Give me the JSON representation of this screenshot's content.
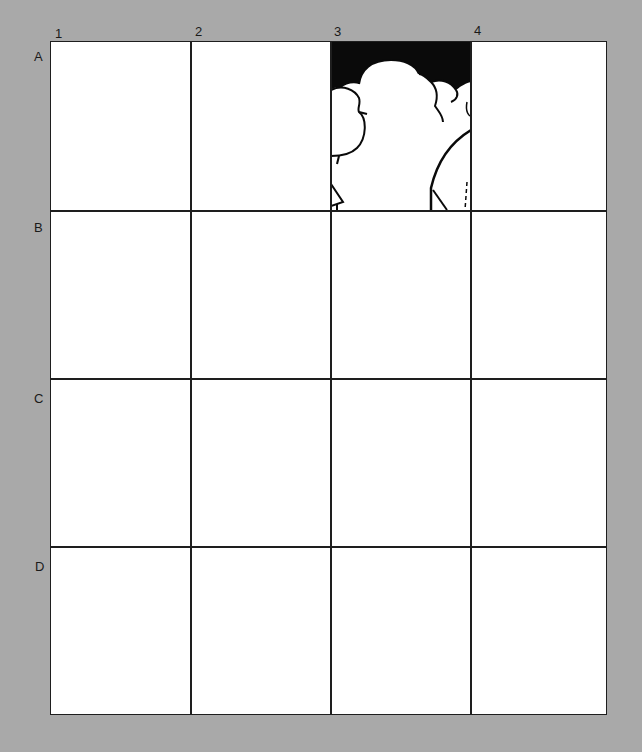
{
  "grid": {
    "columns": [
      "1",
      "2",
      "3",
      "4"
    ],
    "rows": [
      "A",
      "B",
      "C",
      "D"
    ],
    "filled_cell": {
      "row": "A",
      "column": "3",
      "content": "cloud-drawing"
    }
  },
  "colors": {
    "background": "#a9a9a9",
    "cell": "#ffffff",
    "lines": "#1e1e1e",
    "sky": "#0a0a0a"
  }
}
